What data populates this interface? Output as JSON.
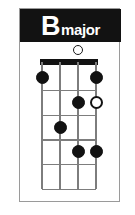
{
  "card": {
    "title": {
      "root": "B",
      "quality": "major",
      "full": "B major"
    },
    "colors": {
      "title_bar_background": "#121212",
      "title_text": "#ffffff",
      "card_background": "#ffffff",
      "card_border": "#9a9a9a",
      "grid_line": "#7d7d7d",
      "nut": "#121212",
      "dot_filled": "#121212",
      "dot_open_fill": "#ffffff",
      "dot_open_stroke": "#121212"
    }
  },
  "chart_data": {
    "type": "table",
    "instrument_strings": 4,
    "frets_shown": 5,
    "starting_fret": 1,
    "string_labels": [
      "1",
      "2",
      "3",
      "4"
    ],
    "fret_labels": [
      "1",
      "2",
      "3",
      "4",
      "5"
    ],
    "open_string_markers": [
      {
        "string": 3,
        "marker": "open-circle"
      }
    ],
    "finger_positions": [
      {
        "string": 1,
        "fret": 1,
        "marker": "filled"
      },
      {
        "string": 4,
        "fret": 1,
        "marker": "filled"
      },
      {
        "string": 3,
        "fret": 2,
        "marker": "filled"
      },
      {
        "string": 4,
        "fret": 2,
        "marker": "open"
      },
      {
        "string": 2,
        "fret": 3,
        "marker": "filled"
      },
      {
        "string": 3,
        "fret": 4,
        "marker": "filled"
      },
      {
        "string": 4,
        "fret": 4,
        "marker": "filled"
      }
    ],
    "legend": [
      {
        "marker": "filled",
        "meaning": "fretted note"
      },
      {
        "marker": "open",
        "meaning": "optional / alternate note"
      }
    ],
    "xlabel": "strings",
    "ylabel": "frets",
    "grid": true
  }
}
